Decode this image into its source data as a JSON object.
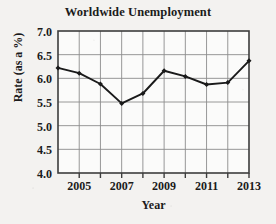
{
  "chart_data": {
    "type": "line",
    "title": "Worldwide Unemployment",
    "xlabel": "Year",
    "ylabel": "Rate (as a %)",
    "x": [
      2004,
      2005,
      2006,
      2007,
      2008,
      2009,
      2010,
      2011,
      2012,
      2013
    ],
    "values": [
      6.22,
      6.11,
      5.88,
      5.47,
      5.68,
      6.16,
      6.04,
      5.87,
      5.91,
      6.37
    ],
    "series": [
      {
        "name": "Unemployment rate",
        "values": [
          6.22,
          6.11,
          5.88,
          5.47,
          5.68,
          6.16,
          6.04,
          5.87,
          5.91,
          6.37
        ]
      }
    ],
    "xlim": [
      2004,
      2013
    ],
    "ylim": [
      4.0,
      7.0
    ],
    "ytick_labels": [
      "7.0",
      "6.5",
      "6.0",
      "5.5",
      "5.0",
      "4.5",
      "4.0"
    ],
    "ytick_values": [
      7.0,
      6.5,
      6.0,
      5.5,
      5.0,
      4.5,
      4.0
    ],
    "xtick_labels": [
      "2005",
      "2007",
      "2009",
      "2011",
      "2013"
    ],
    "xtick_values": [
      2005,
      2007,
      2009,
      2011,
      2013
    ],
    "xtick_minor_values": [
      2004,
      2006,
      2008,
      2010,
      2012
    ],
    "grid": true,
    "legend": "none",
    "line_color": "#1a1a1a",
    "marker": "diamond",
    "grid_color": "#8c8c8c",
    "frame_color": "#3d3d3d",
    "background_color": "#f3f2f0",
    "plot_background_color": "#fbfbfa"
  }
}
